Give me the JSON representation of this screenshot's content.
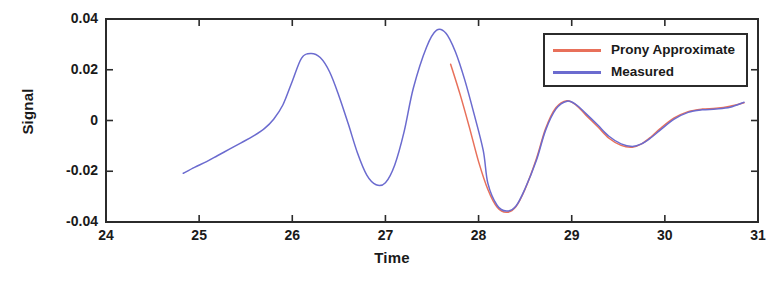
{
  "chart_data": {
    "type": "line",
    "title": "",
    "xlabel": "Time",
    "ylabel": "Signal",
    "xlim": [
      24,
      31
    ],
    "ylim": [
      -0.04,
      0.04
    ],
    "xticks": [
      24,
      25,
      26,
      27,
      28,
      29,
      30,
      31
    ],
    "xtick_labels": [
      "24",
      "25",
      "26",
      "27",
      "28",
      "29",
      "30",
      "31"
    ],
    "yticks": [
      0.04,
      0.02,
      0,
      -0.02,
      -0.04
    ],
    "ytick_labels": [
      "0.04",
      "0.02",
      "0",
      "-0.02",
      "-0.04"
    ],
    "grid": false,
    "legend_position": "upper right",
    "legend_entries": [
      "Prony Approximate",
      "Measured"
    ],
    "colors": {
      "prony_approximate": "#e8705a",
      "measured": "#6b6bcf",
      "axis": "#2b2b2b",
      "text": "#1a1a1a",
      "background": "#ffffff"
    },
    "series": [
      {
        "name": "Measured",
        "color": "#6b6bcf",
        "x": [
          24.83,
          24.95,
          25.08,
          25.2,
          25.33,
          25.45,
          25.58,
          25.7,
          25.8,
          25.9,
          26.0,
          26.1,
          26.2,
          26.3,
          26.4,
          26.5,
          26.6,
          26.7,
          26.8,
          26.9,
          27.0,
          27.1,
          27.2,
          27.3,
          27.44,
          27.55,
          27.65,
          27.75,
          27.85,
          27.95,
          28.05,
          28.1,
          28.2,
          28.3,
          28.4,
          28.5,
          28.62,
          28.72,
          28.83,
          28.95,
          29.05,
          29.15,
          29.28,
          29.4,
          29.53,
          29.65,
          29.75,
          29.85,
          29.95,
          30.1,
          30.25,
          30.4,
          30.55,
          30.7,
          30.85
        ],
        "y": [
          -0.0208,
          -0.0185,
          -0.0162,
          -0.0138,
          -0.0112,
          -0.0088,
          -0.0062,
          -0.0032,
          0.0005,
          0.0062,
          0.0155,
          0.0246,
          0.0264,
          0.0248,
          0.0192,
          0.0098,
          -0.0012,
          -0.0128,
          -0.0215,
          -0.0253,
          -0.0245,
          -0.0175,
          -0.0045,
          0.0128,
          0.0288,
          0.0356,
          0.0344,
          0.0272,
          0.0162,
          0.0028,
          -0.0118,
          -0.0248,
          -0.0335,
          -0.0357,
          -0.0338,
          -0.0268,
          -0.0158,
          -0.0038,
          0.0045,
          0.0076,
          0.0062,
          0.0028,
          -0.0018,
          -0.0062,
          -0.0092,
          -0.0102,
          -0.0092,
          -0.0068,
          -0.0038,
          0.0005,
          0.0032,
          0.0042,
          0.0045,
          0.0052,
          0.0072
        ]
      },
      {
        "name": "Prony Approximate",
        "color": "#e8705a",
        "x": [
          27.7,
          27.8,
          27.9,
          28.0,
          28.1,
          28.2,
          28.3,
          28.4,
          28.5,
          28.62,
          28.72,
          28.83,
          28.95,
          29.05,
          29.15,
          29.28,
          29.4,
          29.53,
          29.65,
          29.75,
          29.85,
          29.95,
          30.1,
          30.25,
          30.4,
          30.55,
          30.7,
          30.85
        ],
        "y": [
          0.0222,
          0.0105,
          -0.0025,
          -0.0162,
          -0.0272,
          -0.0342,
          -0.0362,
          -0.034,
          -0.027,
          -0.0152,
          -0.0032,
          0.005,
          0.0078,
          0.006,
          0.0022,
          -0.0025,
          -0.007,
          -0.0098,
          -0.0105,
          -0.0092,
          -0.0065,
          -0.0032,
          0.001,
          0.0035,
          0.0045,
          0.0048,
          0.0056,
          0.007
        ]
      }
    ]
  },
  "axes": {
    "ylabel": "Signal",
    "xlabel": "Time"
  },
  "legend": {
    "items": [
      {
        "label": "Prony Approximate"
      },
      {
        "label": "Measured"
      }
    ]
  }
}
